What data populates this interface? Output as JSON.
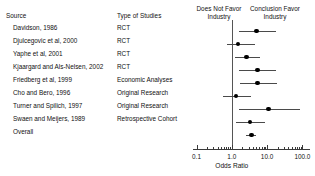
{
  "figure": {
    "type": "forest-plot",
    "columns": {
      "source": "Source",
      "type_of_studies": "Type of Studies",
      "left_header": "Does Not Favor Industry",
      "right_header": "Conclusion Favor Industry"
    },
    "rows": [
      {
        "source": "Davidson, 1986",
        "study_type": "RCT"
      },
      {
        "source": "Djulcegovic et al, 2000",
        "study_type": "RCT"
      },
      {
        "source": "Yaphe et al, 2001",
        "study_type": "RCT"
      },
      {
        "source": "Kjaargard and Als-Nelsen, 2002",
        "study_type": "RCT"
      },
      {
        "source": "Friedberg et al, 1999",
        "study_type": "Economic Analyses"
      },
      {
        "source": "Cho and Bero, 1996",
        "study_type": "Original Research"
      },
      {
        "source": "Turner and Spilich, 1997",
        "study_type": "Original Research"
      },
      {
        "source": "Swaen and Meijers, 1989",
        "study_type": "Retrospective Cohort"
      },
      {
        "source": "Overall",
        "study_type": ""
      }
    ]
  },
  "chart_data": {
    "type": "scatter",
    "title": "",
    "xlabel": "Odds Ratio",
    "ylabel": "",
    "xscale": "log",
    "xlim": [
      0.1,
      100.0
    ],
    "xticks": [
      0.1,
      1.0,
      10.0,
      100.0
    ],
    "xticklabels": [
      "0.1",
      "1.0",
      "10.0",
      "100.0"
    ],
    "grid": false,
    "reference_line": 1.0,
    "legend": null,
    "categories": [
      "Davidson, 1986",
      "Djulcegovic et al, 2000",
      "Yaphe et al, 2001",
      "Kjaargard and Als-Nelsen, 2002",
      "Friedberg et al, 1999",
      "Cho and Bero, 1996",
      "Turner and Spilich, 1997",
      "Swaen and Meijers, 1989",
      "Overall"
    ],
    "points": [
      {
        "label": "Davidson, 1986",
        "odds_ratio": 5.0,
        "ci_low": 1.6,
        "ci_high": 18.0
      },
      {
        "label": "Djulcegovic et al, 2000",
        "odds_ratio": 1.5,
        "ci_low": 0.75,
        "ci_high": 4.5
      },
      {
        "label": "Yaphe et al, 2001",
        "odds_ratio": 2.6,
        "ci_low": 1.2,
        "ci_high": 6.3
      },
      {
        "label": "Kjaargard and Als-Nelsen, 2002",
        "odds_ratio": 5.3,
        "ci_low": 1.6,
        "ci_high": 18.0
      },
      {
        "label": "Friedberg et al, 1999",
        "odds_ratio": 5.3,
        "ci_low": 1.7,
        "ci_high": 19.0
      },
      {
        "label": "Cho and Bero, 1996",
        "odds_ratio": 1.3,
        "ci_low": 0.55,
        "ci_high": 3.6
      },
      {
        "label": "Turner and Spilich, 1997",
        "odds_ratio": 11.0,
        "ci_low": 1.6,
        "ci_high": 85.0
      },
      {
        "label": "Swaen and Meijers, 1989",
        "odds_ratio": 3.3,
        "ci_low": 1.3,
        "ci_high": 8.5
      },
      {
        "label": "Overall",
        "odds_ratio": 3.6,
        "ci_low": 2.6,
        "ci_high": 5.0
      }
    ],
    "marker": "filled-circle",
    "marker_color": "#000000",
    "ci_color": "#4a4a4a"
  }
}
